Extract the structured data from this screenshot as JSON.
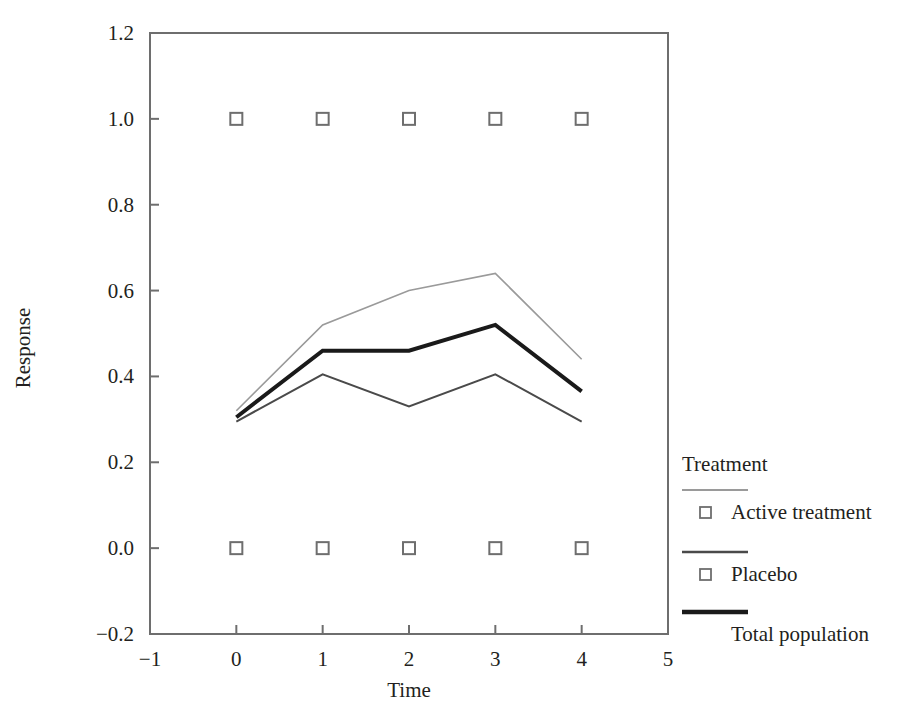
{
  "chart_data": {
    "type": "line",
    "title": "",
    "xlabel": "Time",
    "ylabel": "Response",
    "xlim": [
      -1,
      5
    ],
    "ylim": [
      -0.2,
      1.2
    ],
    "xticks": [
      "−1",
      "0",
      "1",
      "2",
      "3",
      "4",
      "5"
    ],
    "yticks": [
      "1.2",
      "1.0",
      "0.8",
      "0.6",
      "0.4",
      "0.2",
      "0.0",
      "−0.2"
    ],
    "grid": false,
    "legend_position": "right",
    "legend_title": "Treatment",
    "x": [
      0,
      1,
      2,
      3,
      4
    ],
    "series": [
      {
        "name": "Active treatment",
        "values": [
          0.32,
          0.52,
          0.6,
          0.64,
          0.44
        ],
        "color": "#9a9a9a",
        "width": 1.6,
        "marker": "open-square"
      },
      {
        "name": "Placebo",
        "values": [
          0.295,
          0.405,
          0.33,
          0.405,
          0.295
        ],
        "color": "#4a4a4a",
        "width": 2.0,
        "marker": "open-square"
      },
      {
        "name": "Total population",
        "values": [
          0.305,
          0.46,
          0.46,
          0.52,
          0.365
        ],
        "color": "#1a1a1a",
        "width": 4.0,
        "marker": "none"
      }
    ],
    "marker_rows": [
      {
        "y": 1.0,
        "x": [
          0,
          1,
          2,
          3,
          4
        ],
        "marker": "open-square"
      },
      {
        "y": 0.0,
        "x": [
          0,
          1,
          2,
          3,
          4
        ],
        "marker": "open-square"
      }
    ]
  },
  "axes": {
    "y_title": "Response",
    "x_title": "Time",
    "y_tick_labels": [
      "1.2",
      "1.0",
      "0.8",
      "0.6",
      "0.4",
      "0.2",
      "0.0",
      "−0.2"
    ],
    "x_tick_labels": [
      "−1",
      "0",
      "1",
      "2",
      "3",
      "4",
      "5"
    ]
  },
  "legend": {
    "title": "Treatment",
    "entries": [
      {
        "label": "Active treatment",
        "swatch": "thin-gray-line",
        "marker": "open-square-marker"
      },
      {
        "label": "Placebo",
        "swatch": "medium-gray-line",
        "marker": "open-square-marker"
      },
      {
        "label": "Total population",
        "swatch": "thick-black-line",
        "marker": "none"
      }
    ]
  },
  "colors": {
    "frame": "#6e6e6e",
    "text": "#231f20",
    "series_active": "#9a9a9a",
    "series_placebo": "#4a4a4a",
    "series_total": "#1a1a1a",
    "background": "#ffffff"
  }
}
